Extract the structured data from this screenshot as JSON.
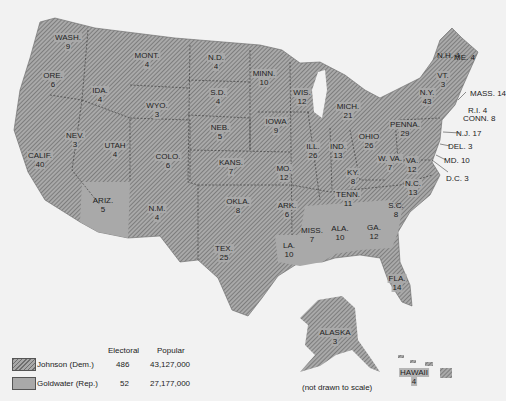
{
  "colors": {
    "johnson_hatch_dark": "#6e6e6e",
    "johnson_hatch_light": "#a8a8a8",
    "goldwater_fill": "#a9a9a9",
    "background": "#f2f2f2"
  },
  "states": [
    {
      "name": "WASH.",
      "votes": "9",
      "x": 68,
      "y": 42,
      "party": "dem"
    },
    {
      "name": "ORE.",
      "votes": "6",
      "x": 53,
      "y": 80,
      "party": "dem"
    },
    {
      "name": "CALIF.",
      "votes": "40",
      "x": 40,
      "y": 160,
      "party": "dem"
    },
    {
      "name": "NEV.",
      "votes": "3",
      "x": 75,
      "y": 140,
      "party": "dem"
    },
    {
      "name": "IDA.",
      "votes": "4",
      "x": 100,
      "y": 95,
      "party": "dem"
    },
    {
      "name": "MONT.",
      "votes": "4",
      "x": 147,
      "y": 60,
      "party": "dem"
    },
    {
      "name": "WYO.",
      "votes": "3",
      "x": 157,
      "y": 110,
      "party": "dem"
    },
    {
      "name": "UTAH",
      "votes": "4",
      "x": 115,
      "y": 150,
      "party": "dem"
    },
    {
      "name": "COLO.",
      "votes": "6",
      "x": 168,
      "y": 161,
      "party": "dem"
    },
    {
      "name": "ARIZ.",
      "votes": "5",
      "x": 103,
      "y": 205,
      "party": "rep"
    },
    {
      "name": "N.M.",
      "votes": "4",
      "x": 157,
      "y": 213,
      "party": "dem"
    },
    {
      "name": "N.D.",
      "votes": "4",
      "x": 216,
      "y": 62,
      "party": "dem"
    },
    {
      "name": "S.D.",
      "votes": "4",
      "x": 218,
      "y": 97,
      "party": "dem"
    },
    {
      "name": "NEB.",
      "votes": "5",
      "x": 220,
      "y": 132,
      "party": "dem"
    },
    {
      "name": "KANS.",
      "votes": "7",
      "x": 231,
      "y": 167,
      "party": "dem"
    },
    {
      "name": "OKLA.",
      "votes": "8",
      "x": 238,
      "y": 206,
      "party": "dem"
    },
    {
      "name": "TEX.",
      "votes": "25",
      "x": 224,
      "y": 253,
      "party": "dem"
    },
    {
      "name": "MINN.",
      "votes": "10",
      "x": 264,
      "y": 78,
      "party": "dem"
    },
    {
      "name": "IOWA",
      "votes": "9",
      "x": 276,
      "y": 126,
      "party": "dem"
    },
    {
      "name": "MO.",
      "votes": "12",
      "x": 284,
      "y": 173,
      "party": "dem"
    },
    {
      "name": "ARK.",
      "votes": "6",
      "x": 287,
      "y": 210,
      "party": "dem"
    },
    {
      "name": "LA.",
      "votes": "10",
      "x": 289,
      "y": 250,
      "party": "rep"
    },
    {
      "name": "WIS.",
      "votes": "12",
      "x": 302,
      "y": 97,
      "party": "dem"
    },
    {
      "name": "ILL.",
      "votes": "26",
      "x": 313,
      "y": 151,
      "party": "dem"
    },
    {
      "name": "MISS.",
      "votes": "7",
      "x": 312,
      "y": 235,
      "party": "rep"
    },
    {
      "name": "MICH.",
      "votes": "21",
      "x": 348,
      "y": 111,
      "party": "dem"
    },
    {
      "name": "IND.",
      "votes": "13",
      "x": 338,
      "y": 151,
      "party": "dem"
    },
    {
      "name": "ALA.",
      "votes": "10",
      "x": 340,
      "y": 233,
      "party": "rep"
    },
    {
      "name": "TENN.",
      "votes": "11",
      "x": 348,
      "y": 199,
      "party": "dem"
    },
    {
      "name": "OHIO",
      "votes": "26",
      "x": 369,
      "y": 141,
      "party": "dem"
    },
    {
      "name": "KY.",
      "votes": "8",
      "x": 353,
      "y": 177,
      "party": "dem"
    },
    {
      "name": "GA.",
      "votes": "12",
      "x": 374,
      "y": 232,
      "party": "rep"
    },
    {
      "name": "FLA.",
      "votes": "14",
      "x": 397,
      "y": 283,
      "party": "dem"
    },
    {
      "name": "S.C.",
      "votes": "8",
      "x": 396,
      "y": 210,
      "party": "rep"
    },
    {
      "name": "N.C.",
      "votes": "13",
      "x": 413,
      "y": 188,
      "party": "dem"
    },
    {
      "name": "VA.",
      "votes": "12",
      "x": 412,
      "y": 165,
      "party": "dem"
    },
    {
      "name": "W. VA.",
      "votes": "7",
      "x": 390,
      "y": 163,
      "party": "dem"
    },
    {
      "name": "PENNA.",
      "votes": "29",
      "x": 405,
      "y": 129,
      "party": "dem"
    },
    {
      "name": "N.Y.",
      "votes": "43",
      "x": 427,
      "y": 97,
      "party": "dem"
    },
    {
      "name": "VT.",
      "votes": "3",
      "x": 443,
      "y": 80,
      "party": "dem"
    },
    {
      "name": "ALASKA",
      "votes": "3",
      "x": 335,
      "y": 337,
      "party": "dem"
    },
    {
      "name": "HAWAII",
      "votes": "4",
      "x": 414,
      "y": 377,
      "party": "dem"
    }
  ],
  "outside_labels": [
    {
      "name": "N.H.",
      "votes": "4",
      "x": 445,
      "y": 55
    },
    {
      "name": "ME.",
      "votes": "4",
      "x": 462,
      "y": 57
    },
    {
      "name": "MASS.",
      "votes": "14",
      "x": 478,
      "y": 93
    },
    {
      "name": "R.I.",
      "votes": "4",
      "x": 476,
      "y": 110
    },
    {
      "name": "CONN.",
      "votes": "8",
      "x": 471,
      "y": 118
    },
    {
      "name": "N.J.",
      "votes": "17",
      "x": 464,
      "y": 133
    },
    {
      "name": "DEL.",
      "votes": "3",
      "x": 456,
      "y": 146
    },
    {
      "name": "MD.",
      "votes": "10",
      "x": 452,
      "y": 160
    },
    {
      "name": "D.C.",
      "votes": "3",
      "x": 454,
      "y": 178
    }
  ],
  "note": "(not drawn to scale)",
  "legend": {
    "col_electoral": "Electoral",
    "col_popular": "Popular",
    "rows": [
      {
        "label": "Johnson  (Dem.)",
        "electoral": "486",
        "popular": "43,127,000",
        "party": "dem"
      },
      {
        "label": "Goldwater  (Rep.)",
        "electoral": "52",
        "popular": "27,177,000",
        "party": "rep"
      }
    ]
  }
}
